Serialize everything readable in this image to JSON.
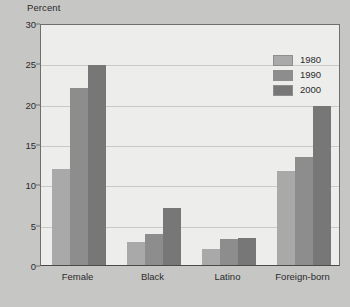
{
  "chart_data": {
    "type": "bar",
    "title": "",
    "xlabel": "",
    "ylabel": "Percent",
    "ylim": [
      0,
      30
    ],
    "ytick_step": 5,
    "ytick_labels": [
      "0",
      "5",
      "10",
      "15",
      "20",
      "25",
      "30"
    ],
    "grid": true,
    "legend_position": "top-right-inside",
    "categories": [
      "Female",
      "Black",
      "Latino",
      "Foreign-born"
    ],
    "series": [
      {
        "name": "1980",
        "color": "#a9a9a9",
        "values": [
          11.9,
          2.9,
          2.0,
          11.6
        ]
      },
      {
        "name": "1990",
        "color": "#8d8d8d",
        "values": [
          22.0,
          3.8,
          3.2,
          13.4
        ]
      },
      {
        "name": "2000",
        "color": "#777777",
        "values": [
          24.8,
          7.1,
          3.4,
          19.7
        ]
      }
    ]
  },
  "axis_title": "Percent",
  "caption": "",
  "colors": {
    "page_background": "#c6c6c4",
    "plot_background": "#edeeec",
    "gridline": "#c9cac7",
    "axis": "#6f6f6f",
    "text": "#2b2b2b"
  }
}
